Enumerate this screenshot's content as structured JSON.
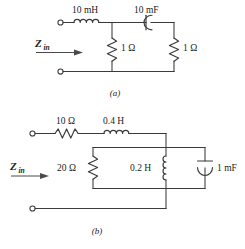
{
  "figure": {
    "background_color": "#ffffff",
    "wire_color": "#3a3a3a",
    "text_color": "#222222"
  },
  "circuit_a": {
    "caption": "(a)",
    "zin_symbol": "Z",
    "zin_subscript": "in",
    "components": {
      "series_inductor": {
        "label": "10 mH",
        "icon": "inductor-coil-icon",
        "orientation": "horizontal"
      },
      "series_capacitor": {
        "label": "10 mF",
        "icon": "capacitor-curved-icon",
        "orientation": "horizontal"
      },
      "shunt_resistor_left": {
        "label": "1 Ω",
        "icon": "resistor-zigzag-icon",
        "orientation": "vertical"
      },
      "shunt_resistor_right": {
        "label": "1 Ω",
        "icon": "resistor-zigzag-icon",
        "orientation": "vertical"
      }
    },
    "terminals": [
      "top-input-terminal",
      "bottom-input-terminal"
    ]
  },
  "circuit_b": {
    "caption": "(b)",
    "zin_symbol": "Z",
    "zin_subscript": "in",
    "components": {
      "series_resistor": {
        "label": "10 Ω",
        "icon": "resistor-zigzag-icon",
        "orientation": "horizontal"
      },
      "series_inductor": {
        "label": "0.4 H",
        "icon": "inductor-coil-icon",
        "orientation": "horizontal"
      },
      "parallel_resistor": {
        "label": "20 Ω",
        "icon": "resistor-zigzag-icon",
        "orientation": "vertical"
      },
      "parallel_inductor": {
        "label": "0.2 H",
        "icon": "inductor-coil-icon",
        "orientation": "vertical"
      },
      "parallel_capacitor": {
        "label": "1 mF",
        "icon": "capacitor-curved-icon",
        "orientation": "vertical"
      }
    },
    "terminals": [
      "top-input-terminal",
      "bottom-input-terminal"
    ]
  }
}
